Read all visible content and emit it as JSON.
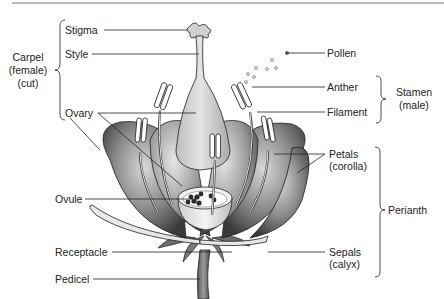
{
  "diagram": {
    "labels": {
      "stigma": "Stigma",
      "style": "Style",
      "ovary": "Ovary",
      "ovule": "Ovule",
      "receptacle": "Receptacle",
      "pedicel": "Pedicel",
      "pollen": "Pollen",
      "anther": "Anther",
      "filament": "Filament",
      "petals": "Petals",
      "petals_sub": "(corolla)",
      "sepals": "Sepals",
      "sepals_sub": "(calyx)"
    },
    "groups": {
      "carpel": {
        "line1": "Carpel",
        "line2": "(female)",
        "line3": "(cut)"
      },
      "stamen": {
        "line1": "Stamen",
        "line2": "(male)"
      },
      "perianth": {
        "line1": "Perianth"
      }
    }
  }
}
